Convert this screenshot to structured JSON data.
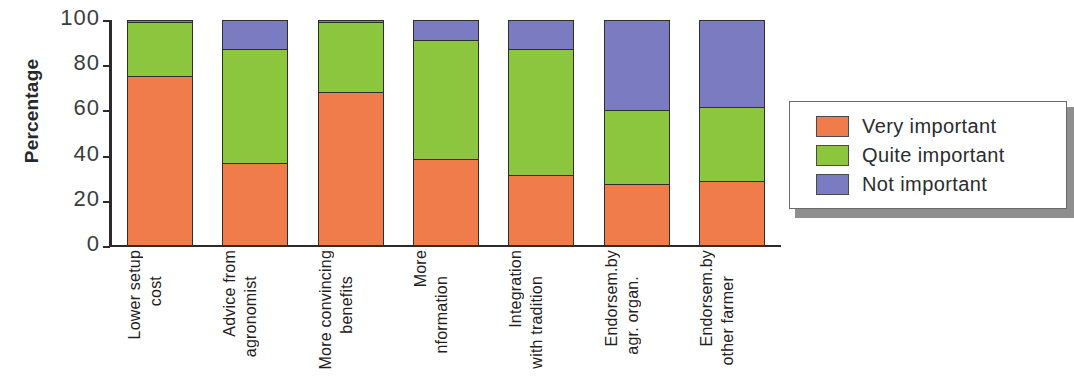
{
  "chart_data": {
    "type": "bar",
    "subtype": "stacked-bar-100",
    "title": "",
    "xlabel": "",
    "ylabel": "Percentage",
    "ylim": [
      0,
      100
    ],
    "yticks": [
      0,
      20,
      40,
      60,
      80,
      100
    ],
    "ytick_labels": [
      "0",
      "20",
      "40",
      "60",
      "80",
      "100"
    ],
    "grid": false,
    "legend_position": "right",
    "categories": [
      "Lower setup cost",
      "Advice from agronomist",
      "More convincing benefits",
      "More nformation",
      "Integration with tradition",
      "Endorsem.by agr. organ.",
      "Endorsem.by other farmer"
    ],
    "category_lines": [
      [
        "Lower setup",
        "cost"
      ],
      [
        "Advice from",
        "agronomist"
      ],
      [
        "More convincing",
        "benefits"
      ],
      [
        "More",
        "nformation"
      ],
      [
        "Integration",
        "with tradition"
      ],
      [
        "Endorsem.by",
        "agr. organ."
      ],
      [
        "Endorsem.by",
        "other farmer"
      ]
    ],
    "series": [
      {
        "name": "Very important",
        "color": "#F07B4B",
        "values": [
          75,
          36,
          68,
          38,
          31,
          27,
          28
        ]
      },
      {
        "name": "Quite important",
        "color": "#8CC63E",
        "values": [
          24,
          51,
          31,
          53,
          56,
          33,
          33
        ]
      },
      {
        "name": "Not important",
        "color": "#7B7BC2",
        "values": [
          1,
          13,
          1,
          9,
          13,
          40,
          39
        ]
      }
    ]
  },
  "axis": {
    "y_title": "Percentage"
  },
  "legend": {
    "items": [
      {
        "label": "Very important",
        "color": "#F07B4B"
      },
      {
        "label": "Quite important",
        "color": "#8CC63E"
      },
      {
        "label": "Not important",
        "color": "#7B7BC2"
      }
    ]
  }
}
